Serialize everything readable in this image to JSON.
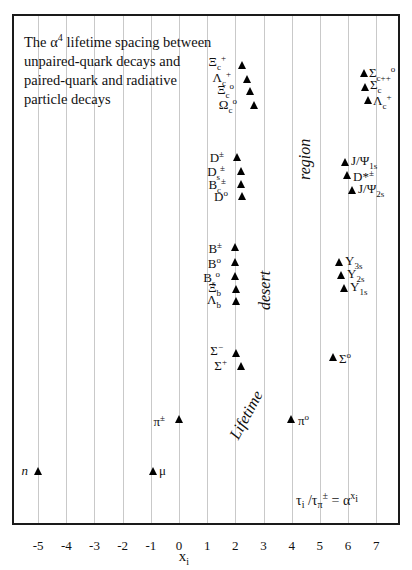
{
  "chart_data": {
    "type": "scatter",
    "title": "The α4 lifetime spacing between unpaired-quark decays and paired-quark and radiative particle decays",
    "title_lines": [
      "The α",
      "4",
      " lifetime spacing between",
      "unpaired-quark decays and",
      "paired-quark and radiative",
      "particle decays"
    ],
    "xlabel": "x",
    "xlabel_sub": "i",
    "ylabel": "",
    "xlim": [
      -5.9,
      7.9
    ],
    "x_ticks": [
      -5,
      -4,
      -3,
      -2,
      -1,
      0,
      1,
      2,
      3,
      4,
      5,
      6,
      7
    ],
    "grid": "vertical",
    "formula": {
      "lhs": "τ",
      "lhs_sub": "i",
      "mid": " /τ",
      "mid_sub": "π",
      "mid_sup": "±",
      "eq": " = α",
      "rhs_sup": "x",
      "rhs_sup_sub": "i"
    },
    "region_labels": [
      "Lifetime",
      "desert",
      "region"
    ],
    "points": [
      {
        "name": "n",
        "x": -5.0,
        "group": "leptons/nucleon"
      },
      {
        "name": "μ",
        "x": -1.0,
        "group": "leptons/nucleon"
      },
      {
        "name": "π±",
        "x": 0.0,
        "group": "unpaired"
      },
      {
        "name": "π0",
        "x": 4.0,
        "group": "radiative"
      },
      {
        "name": "Σ−",
        "x": 1.0,
        "group": "unpaired"
      },
      {
        "name": "Σ+",
        "x": 1.15,
        "group": "unpaired"
      },
      {
        "name": "Σ0",
        "x": 5.5,
        "group": "radiative"
      },
      {
        "name": "B±",
        "x": 2.0,
        "group": "unpaired"
      },
      {
        "name": "B0",
        "x": 2.05,
        "group": "unpaired"
      },
      {
        "name": "Bs0",
        "x": 2.05,
        "group": "unpaired"
      },
      {
        "name": "Ξb",
        "x": 2.05,
        "group": "unpaired"
      },
      {
        "name": "Λb",
        "x": 2.05,
        "group": "unpaired"
      },
      {
        "name": "Υ3s",
        "x": 5.7,
        "group": "paired"
      },
      {
        "name": "Υ2s",
        "x": 5.8,
        "group": "paired"
      },
      {
        "name": "Υ1s",
        "x": 5.85,
        "group": "paired"
      },
      {
        "name": "D±",
        "x": 2.0,
        "group": "unpaired"
      },
      {
        "name": "Ds±",
        "x": 2.2,
        "group": "unpaired"
      },
      {
        "name": "Bc±",
        "x": 2.2,
        "group": "unpaired"
      },
      {
        "name": "D0",
        "x": 2.2,
        "group": "unpaired"
      },
      {
        "name": "J/Ψ1s",
        "x": 5.95,
        "group": "paired"
      },
      {
        "name": "D*±",
        "x": 6.0,
        "group": "radiative"
      },
      {
        "name": "J/Ψ2s",
        "x": 6.15,
        "group": "paired"
      },
      {
        "name": "Ξc+",
        "x": 2.2,
        "group": "unpaired"
      },
      {
        "name": "Λc+",
        "x": 2.35,
        "group": "unpaired"
      },
      {
        "name": "Ξc0",
        "x": 2.5,
        "group": "unpaired"
      },
      {
        "name": "Ωc0",
        "x": 2.65,
        "group": "unpaired"
      },
      {
        "name": "Σc++,0",
        "x": 6.5,
        "group": "paired"
      },
      {
        "name": "Σc",
        "x": 6.55,
        "group": "paired"
      },
      {
        "name": "Λc+",
        "x": 6.6,
        "group": "paired"
      }
    ]
  },
  "labels": {
    "n": "n",
    "mu": "μ",
    "pi_pm": {
      "base": "π",
      "sup": "±"
    },
    "pi_0": {
      "base": "π",
      "sup": "o"
    },
    "sigma_minus": {
      "base": "Σ",
      "sup": "−"
    },
    "sigma_plus": {
      "base": "Σ",
      "sup": "+"
    },
    "sigma_0": {
      "base": "Σ",
      "sup": "o"
    },
    "B_pm": {
      "base": "B",
      "sup": "±"
    },
    "B_0": {
      "base": "B",
      "sup": "o"
    },
    "Bs_0": {
      "base": "B",
      "sub": "s",
      "sup": "o"
    },
    "Xi_b": {
      "base": "Ξ",
      "sub": "b"
    },
    "Lambda_b": {
      "base": "Λ",
      "sub": "b"
    },
    "Y3s": {
      "base": "Υ",
      "sub": "3s"
    },
    "Y2s": {
      "base": "Υ",
      "sub": "2s"
    },
    "Y1s": {
      "base": "Υ",
      "sub": "1s"
    },
    "D_pm": {
      "base": "D",
      "sup": "±"
    },
    "Ds_pm": {
      "base": "D",
      "sub": "s",
      "sup": "±"
    },
    "Bc_pm": {
      "base": "B",
      "sub": "c",
      "sup": "±"
    },
    "D_0": {
      "base": "D",
      "sup": "o"
    },
    "JPsi1s": {
      "base": "J/Ψ",
      "sub": "1s"
    },
    "Dstar_pm": {
      "base": "D*",
      "sup": "±"
    },
    "JPsi2s": {
      "base": "J/Ψ",
      "sub": "2s"
    },
    "Xi_c_plus": {
      "base": "Ξ",
      "sub": "c",
      "sup": "+"
    },
    "Lambda_c_plus_left": {
      "base": "Λ",
      "sub": "c",
      "sup": "+"
    },
    "Xi_c_0": {
      "base": "Ξ",
      "sub": "c",
      "sup": "o"
    },
    "Omega_c_0": {
      "base": "Ω",
      "sub": "c",
      "sup": "o"
    },
    "Sigma_c_pp0": {
      "base": "Σ",
      "sub": "c++",
      "sup": "o"
    },
    "Sigma_c": {
      "base": "Σ",
      "sub": "c"
    },
    "Lambda_c_plus_right": {
      "base": "Λ",
      "sub": "c",
      "sup": "+"
    }
  },
  "ticks": [
    "-5",
    "-4",
    "-3",
    "-2",
    "-1",
    "0",
    "1",
    "2",
    "3",
    "4",
    "5",
    "6",
    "7"
  ]
}
